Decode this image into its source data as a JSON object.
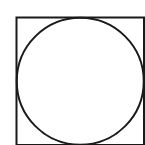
{
  "diagram": {
    "stroke_color": "#1a1a1a",
    "background": "#ffffff",
    "square": {
      "x": 16.5,
      "y": 17.5,
      "size": 127.5,
      "stroke_width": 2
    },
    "circle": {
      "cx": 80.25,
      "cy": 81.25,
      "r": 63.5,
      "stroke_width": 2
    }
  }
}
